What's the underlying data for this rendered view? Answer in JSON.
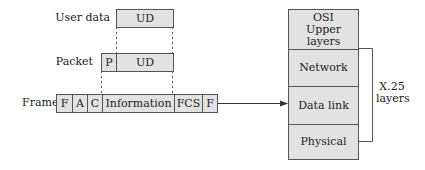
{
  "diagram": {
    "rows": {
      "user_data": {
        "label": "User data",
        "cells": [
          "UD"
        ]
      },
      "packet": {
        "label": "Packet",
        "cells": [
          "P",
          "UD"
        ]
      },
      "frame": {
        "label": "Frame",
        "cells": [
          "F",
          "A",
          "C",
          "Information",
          "FCS",
          "F"
        ]
      }
    },
    "osi_stack": {
      "layers": [
        {
          "line1": "OSI",
          "line2": "Upper layers"
        },
        {
          "line1": "Network"
        },
        {
          "line1": "Data link"
        },
        {
          "line1": "Physical"
        }
      ]
    },
    "bracket_label": {
      "line1": "X.25",
      "line2": "layers"
    },
    "colors": {
      "fill": "#e2e2e2",
      "stroke": "#555555",
      "text": "#222222"
    }
  }
}
